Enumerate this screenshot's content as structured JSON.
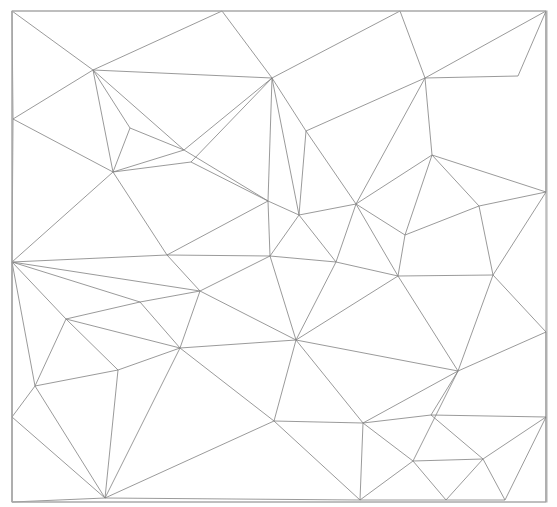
{
  "figure": {
    "name": "triangular-mesh",
    "type": "planar-triangulation",
    "background_color": "#ffffff",
    "edge_color": "#808080",
    "frame_color": "#b0b0b0",
    "edge_width": 0.8,
    "width": 557,
    "height": 507
  },
  "chart_data": {
    "type": "scatter",
    "title": "",
    "subtitle": "",
    "xlabel": "",
    "ylabel": "",
    "grid": false,
    "legend": null,
    "axis_visible": false,
    "tick_labels": [],
    "annotations": [],
    "xlim": [
      12,
      547
    ],
    "ylim": [
      11,
      502
    ],
    "frame": {
      "x": 12,
      "y": 11,
      "width": 535,
      "height": 491
    },
    "vertices": [
      [
        12,
        11
      ],
      [
        222,
        11
      ],
      [
        400,
        11
      ],
      [
        546,
        11
      ],
      [
        93,
        70
      ],
      [
        272,
        78
      ],
      [
        425,
        78
      ],
      [
        518,
        76
      ],
      [
        13,
        119
      ],
      [
        130,
        128
      ],
      [
        306,
        131
      ],
      [
        184,
        150
      ],
      [
        432,
        155
      ],
      [
        113,
        172
      ],
      [
        191,
        162
      ],
      [
        546,
        192
      ],
      [
        479,
        206
      ],
      [
        268,
        201
      ],
      [
        299,
        215
      ],
      [
        356,
        204
      ],
      [
        405,
        235
      ],
      [
        12,
        262
      ],
      [
        167,
        255
      ],
      [
        270,
        256
      ],
      [
        398,
        276
      ],
      [
        493,
        275
      ],
      [
        200,
        291
      ],
      [
        336,
        262
      ],
      [
        140,
        302
      ],
      [
        66,
        319
      ],
      [
        546,
        332
      ],
      [
        296,
        340
      ],
      [
        180,
        348
      ],
      [
        35,
        386
      ],
      [
        118,
        370
      ],
      [
        458,
        371
      ],
      [
        12,
        417
      ],
      [
        274,
        421
      ],
      [
        363,
        423
      ],
      [
        431,
        415
      ],
      [
        546,
        417
      ],
      [
        413,
        461
      ],
      [
        483,
        459
      ],
      [
        105,
        498
      ],
      [
        360,
        500
      ],
      [
        446,
        500
      ],
      [
        505,
        500
      ],
      [
        12,
        502
      ],
      [
        546,
        502
      ]
    ],
    "edges": [
      [
        [
          12,
          11
        ],
        [
          546,
          11
        ]
      ],
      [
        [
          546,
          11
        ],
        [
          546,
          502
        ]
      ],
      [
        [
          546,
          502
        ],
        [
          12,
          502
        ]
      ],
      [
        [
          12,
          502
        ],
        [
          12,
          11
        ]
      ],
      [
        [
          12,
          11
        ],
        [
          93,
          70
        ]
      ],
      [
        [
          93,
          70
        ],
        [
          222,
          11
        ]
      ],
      [
        [
          222,
          11
        ],
        [
          272,
          78
        ]
      ],
      [
        [
          272,
          78
        ],
        [
          400,
          11
        ]
      ],
      [
        [
          400,
          11
        ],
        [
          425,
          78
        ]
      ],
      [
        [
          425,
          78
        ],
        [
          546,
          11
        ]
      ],
      [
        [
          546,
          11
        ],
        [
          518,
          76
        ]
      ],
      [
        [
          518,
          76
        ],
        [
          425,
          78
        ]
      ],
      [
        [
          93,
          70
        ],
        [
          13,
          119
        ]
      ],
      [
        [
          13,
          119
        ],
        [
          12,
          11
        ]
      ],
      [
        [
          93,
          70
        ],
        [
          272,
          78
        ]
      ],
      [
        [
          93,
          70
        ],
        [
          130,
          128
        ]
      ],
      [
        [
          93,
          70
        ],
        [
          113,
          172
        ]
      ],
      [
        [
          130,
          128
        ],
        [
          113,
          172
        ]
      ],
      [
        [
          130,
          128
        ],
        [
          184,
          150
        ]
      ],
      [
        [
          184,
          150
        ],
        [
          113,
          172
        ]
      ],
      [
        [
          93,
          70
        ],
        [
          184,
          150
        ]
      ],
      [
        [
          184,
          150
        ],
        [
          272,
          78
        ]
      ],
      [
        [
          272,
          78
        ],
        [
          268,
          201
        ]
      ],
      [
        [
          184,
          150
        ],
        [
          268,
          201
        ]
      ],
      [
        [
          13,
          119
        ],
        [
          113,
          172
        ]
      ],
      [
        [
          13,
          119
        ],
        [
          12,
          262
        ]
      ],
      [
        [
          113,
          172
        ],
        [
          12,
          262
        ]
      ],
      [
        [
          113,
          172
        ],
        [
          191,
          162
        ]
      ],
      [
        [
          191,
          162
        ],
        [
          272,
          78
        ]
      ],
      [
        [
          191,
          162
        ],
        [
          268,
          201
        ]
      ],
      [
        [
          272,
          78
        ],
        [
          306,
          131
        ]
      ],
      [
        [
          306,
          131
        ],
        [
          425,
          78
        ]
      ],
      [
        [
          306,
          131
        ],
        [
          356,
          204
        ]
      ],
      [
        [
          306,
          131
        ],
        [
          299,
          215
        ]
      ],
      [
        [
          272,
          78
        ],
        [
          299,
          215
        ]
      ],
      [
        [
          299,
          215
        ],
        [
          268,
          201
        ]
      ],
      [
        [
          425,
          78
        ],
        [
          432,
          155
        ]
      ],
      [
        [
          432,
          155
        ],
        [
          546,
          192
        ]
      ],
      [
        [
          546,
          192
        ],
        [
          546,
          11
        ]
      ],
      [
        [
          432,
          155
        ],
        [
          479,
          206
        ]
      ],
      [
        [
          479,
          206
        ],
        [
          546,
          192
        ]
      ],
      [
        [
          425,
          78
        ],
        [
          356,
          204
        ]
      ],
      [
        [
          356,
          204
        ],
        [
          432,
          155
        ]
      ],
      [
        [
          356,
          204
        ],
        [
          405,
          235
        ]
      ],
      [
        [
          405,
          235
        ],
        [
          432,
          155
        ]
      ],
      [
        [
          405,
          235
        ],
        [
          479,
          206
        ]
      ],
      [
        [
          356,
          204
        ],
        [
          398,
          276
        ]
      ],
      [
        [
          398,
          276
        ],
        [
          405,
          235
        ]
      ],
      [
        [
          398,
          276
        ],
        [
          493,
          275
        ]
      ],
      [
        [
          493,
          275
        ],
        [
          479,
          206
        ]
      ],
      [
        [
          493,
          275
        ],
        [
          546,
          192
        ]
      ],
      [
        [
          493,
          275
        ],
        [
          546,
          332
        ]
      ],
      [
        [
          299,
          215
        ],
        [
          356,
          204
        ]
      ],
      [
        [
          299,
          215
        ],
        [
          336,
          262
        ]
      ],
      [
        [
          336,
          262
        ],
        [
          356,
          204
        ]
      ],
      [
        [
          336,
          262
        ],
        [
          398,
          276
        ]
      ],
      [
        [
          299,
          215
        ],
        [
          270,
          256
        ]
      ],
      [
        [
          270,
          256
        ],
        [
          336,
          262
        ]
      ],
      [
        [
          268,
          201
        ],
        [
          270,
          256
        ]
      ],
      [
        [
          167,
          255
        ],
        [
          268,
          201
        ]
      ],
      [
        [
          167,
          255
        ],
        [
          113,
          172
        ]
      ],
      [
        [
          167,
          255
        ],
        [
          12,
          262
        ]
      ],
      [
        [
          167,
          255
        ],
        [
          270,
          256
        ]
      ],
      [
        [
          167,
          255
        ],
        [
          200,
          291
        ]
      ],
      [
        [
          200,
          291
        ],
        [
          270,
          256
        ]
      ],
      [
        [
          12,
          262
        ],
        [
          200,
          291
        ]
      ],
      [
        [
          12,
          262
        ],
        [
          140,
          302
        ]
      ],
      [
        [
          140,
          302
        ],
        [
          200,
          291
        ]
      ],
      [
        [
          12,
          262
        ],
        [
          66,
          319
        ]
      ],
      [
        [
          66,
          319
        ],
        [
          140,
          302
        ]
      ],
      [
        [
          200,
          291
        ],
        [
          180,
          348
        ]
      ],
      [
        [
          180,
          348
        ],
        [
          140,
          302
        ]
      ],
      [
        [
          66,
          319
        ],
        [
          180,
          348
        ]
      ],
      [
        [
          200,
          291
        ],
        [
          296,
          340
        ]
      ],
      [
        [
          296,
          340
        ],
        [
          270,
          256
        ]
      ],
      [
        [
          296,
          340
        ],
        [
          336,
          262
        ]
      ],
      [
        [
          180,
          348
        ],
        [
          296,
          340
        ]
      ],
      [
        [
          296,
          340
        ],
        [
          398,
          276
        ]
      ],
      [
        [
          296,
          340
        ],
        [
          458,
          371
        ]
      ],
      [
        [
          458,
          371
        ],
        [
          398,
          276
        ]
      ],
      [
        [
          458,
          371
        ],
        [
          493,
          275
        ]
      ],
      [
        [
          458,
          371
        ],
        [
          546,
          332
        ]
      ],
      [
        [
          66,
          319
        ],
        [
          35,
          386
        ]
      ],
      [
        [
          35,
          386
        ],
        [
          12,
          262
        ]
      ],
      [
        [
          35,
          386
        ],
        [
          118,
          370
        ]
      ],
      [
        [
          118,
          370
        ],
        [
          66,
          319
        ]
      ],
      [
        [
          118,
          370
        ],
        [
          180,
          348
        ]
      ],
      [
        [
          35,
          386
        ],
        [
          12,
          417
        ]
      ],
      [
        [
          12,
          417
        ],
        [
          12,
          262
        ]
      ],
      [
        [
          12,
          417
        ],
        [
          105,
          498
        ]
      ],
      [
        [
          35,
          386
        ],
        [
          105,
          498
        ]
      ],
      [
        [
          118,
          370
        ],
        [
          105,
          498
        ]
      ],
      [
        [
          180,
          348
        ],
        [
          105,
          498
        ]
      ],
      [
        [
          180,
          348
        ],
        [
          274,
          421
        ]
      ],
      [
        [
          274,
          421
        ],
        [
          105,
          498
        ]
      ],
      [
        [
          274,
          421
        ],
        [
          296,
          340
        ]
      ],
      [
        [
          274,
          421
        ],
        [
          363,
          423
        ]
      ],
      [
        [
          363,
          423
        ],
        [
          296,
          340
        ]
      ],
      [
        [
          363,
          423
        ],
        [
          458,
          371
        ]
      ],
      [
        [
          274,
          421
        ],
        [
          360,
          500
        ]
      ],
      [
        [
          363,
          423
        ],
        [
          360,
          500
        ]
      ],
      [
        [
          360,
          500
        ],
        [
          105,
          498
        ]
      ],
      [
        [
          363,
          423
        ],
        [
          413,
          461
        ]
      ],
      [
        [
          413,
          461
        ],
        [
          458,
          371
        ]
      ],
      [
        [
          413,
          461
        ],
        [
          360,
          500
        ]
      ],
      [
        [
          413,
          461
        ],
        [
          446,
          500
        ]
      ],
      [
        [
          446,
          500
        ],
        [
          360,
          500
        ]
      ],
      [
        [
          458,
          371
        ],
        [
          431,
          415
        ]
      ],
      [
        [
          431,
          415
        ],
        [
          363,
          423
        ]
      ],
      [
        [
          431,
          415
        ],
        [
          546,
          417
        ]
      ],
      [
        [
          546,
          417
        ],
        [
          546,
          332
        ]
      ],
      [
        [
          431,
          415
        ],
        [
          483,
          459
        ]
      ],
      [
        [
          483,
          459
        ],
        [
          546,
          417
        ]
      ],
      [
        [
          483,
          459
        ],
        [
          413,
          461
        ]
      ],
      [
        [
          483,
          459
        ],
        [
          446,
          500
        ]
      ],
      [
        [
          483,
          459
        ],
        [
          505,
          500
        ]
      ],
      [
        [
          505,
          500
        ],
        [
          446,
          500
        ]
      ],
      [
        [
          505,
          500
        ],
        [
          546,
          417
        ]
      ],
      [
        [
          546,
          417
        ],
        [
          546,
          502
        ]
      ],
      [
        [
          12,
          417
        ],
        [
          12,
          502
        ]
      ],
      [
        [
          105,
          498
        ],
        [
          12,
          502
        ]
      ]
    ]
  }
}
